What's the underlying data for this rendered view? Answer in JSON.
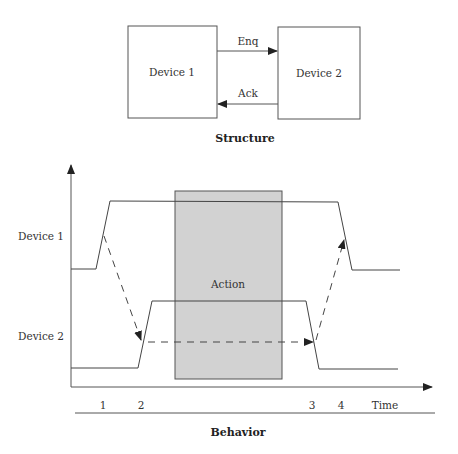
{
  "clipped_top_text": "...g ... p ...",
  "structure": {
    "title": "Structure",
    "device1": "Device 1",
    "device2": "Device 2",
    "enq_label": "Enq",
    "ack_label": "Ack"
  },
  "behavior": {
    "title": "Behavior",
    "action_label": "Action",
    "y_labels": [
      "Device 1",
      "Device 2"
    ],
    "time_ticks": [
      "1",
      "2",
      "3",
      "4"
    ],
    "time_label": "Time",
    "colors": {
      "action_fill": "#d2d2d2",
      "line": "#444444"
    }
  }
}
